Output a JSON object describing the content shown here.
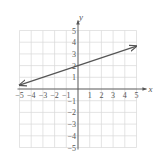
{
  "chart_data": {
    "type": "line",
    "title": "",
    "xlabel": "x",
    "ylabel": "y",
    "xlim": [
      -5,
      5
    ],
    "ylim": [
      -5,
      5
    ],
    "grid": true,
    "x_ticks": [
      "-5",
      "-4",
      "-3",
      "-2",
      "-1",
      "1",
      "2",
      "3",
      "4",
      "5"
    ],
    "y_ticks": [
      "5",
      "4",
      "3",
      "2",
      "1",
      "-1",
      "-2",
      "-3",
      "-4",
      "-5"
    ],
    "series": [
      {
        "name": "y = (1/3)x + 2",
        "x": [
          -5,
          0,
          5
        ],
        "y": [
          0.33,
          2,
          3.67
        ],
        "arrows": "both"
      }
    ]
  },
  "colors": {
    "grid": "#d9d9d9",
    "axis": "#555555",
    "line": "#555555"
  },
  "labels": {
    "x_axis": "x",
    "y_axis": "y"
  }
}
